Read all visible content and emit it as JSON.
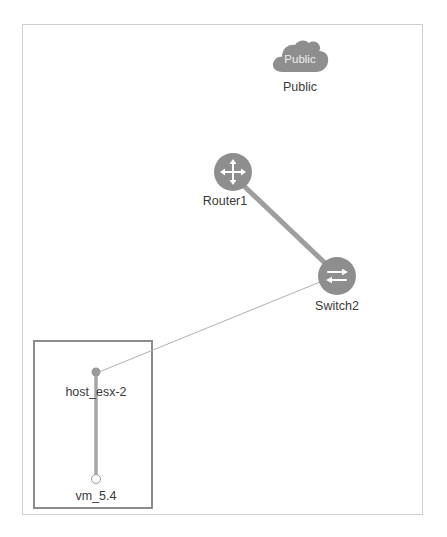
{
  "diagram": {
    "type": "network-topology",
    "background_color": "#ffffff",
    "frame": {
      "border_color": "#cfcfcf",
      "x": 22,
      "y": 24,
      "width": 401,
      "height": 491
    },
    "group_box": {
      "label": "",
      "border_color": "#8c8c8c",
      "x": 33,
      "y": 340,
      "width": 120,
      "height": 169
    },
    "node_color": "#8e8e8e",
    "edge_color_thick": "#9e9e9e",
    "edge_color_thin": "#b0b0b0",
    "label_color": "#3a3a3a"
  },
  "nodes": [
    {
      "id": "public",
      "label": "Public",
      "inner_label": "Public",
      "icon": "cloud-icon",
      "shape": "cloud",
      "x": 300,
      "y": 58,
      "label_x": 300,
      "label_y": 80
    },
    {
      "id": "router1",
      "label": "Router1",
      "icon": "router-icon",
      "shape": "circle",
      "x": 233,
      "y": 172,
      "label_x": 225,
      "label_y": 194
    },
    {
      "id": "switch2",
      "label": "Switch2",
      "icon": "switch-icon",
      "shape": "circle",
      "x": 337,
      "y": 276,
      "label_x": 337,
      "label_y": 299
    },
    {
      "id": "host_esx-2",
      "label": "host_esx-2",
      "icon": "host-dot-icon",
      "shape": "dot-filled",
      "x": 96,
      "y": 372,
      "label_x": 96,
      "label_y": 385
    },
    {
      "id": "vm_5.4",
      "label": "vm_5.4",
      "icon": "vm-dot-icon",
      "shape": "dot-hollow",
      "x": 96,
      "y": 479,
      "label_x": 96,
      "label_y": 489
    }
  ],
  "links": [
    {
      "id": "router1-switch2",
      "from": "router1",
      "to": "switch2",
      "x1": 245,
      "y1": 187,
      "x2": 326,
      "y2": 264,
      "width": 5,
      "color": "#9e9e9e"
    },
    {
      "id": "switch2-host_esx-2",
      "from": "switch2",
      "to": "host_esx-2",
      "x1": 320,
      "y1": 282,
      "x2": 99,
      "y2": 372,
      "width": 1,
      "color": "#b0b0b0"
    },
    {
      "id": "host_esx-2-vm_5.4",
      "from": "host_esx-2",
      "to": "vm_5.4",
      "x1": 96,
      "y1": 372,
      "x2": 96,
      "y2": 478,
      "width": 3.5,
      "color": "#a6a6a6"
    }
  ]
}
